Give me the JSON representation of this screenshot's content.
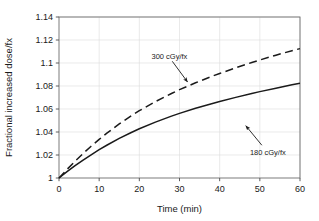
{
  "chart_data": {
    "type": "line",
    "title": "",
    "xlabel": "Time (min)",
    "ylabel": "Fractional increased dose/fx",
    "xlim": [
      0,
      60
    ],
    "ylim": [
      1,
      1.14
    ],
    "xticks": [
      "0",
      "10",
      "20",
      "30",
      "40",
      "50",
      "60"
    ],
    "yticks": [
      "1",
      "1.02",
      "1.04",
      "1.06",
      "1.08",
      "1.1",
      "1.12",
      "1.14"
    ],
    "xtick_values": [
      0,
      10,
      20,
      30,
      40,
      50,
      60
    ],
    "ytick_values": [
      1,
      1.02,
      1.04,
      1.06,
      1.08,
      1.1,
      1.12,
      1.14
    ],
    "grid": true,
    "legend": "annotations",
    "x": [
      0,
      2,
      4,
      6,
      8,
      10,
      12,
      15,
      18,
      20,
      24,
      28,
      30,
      34,
      38,
      40,
      44,
      48,
      50,
      54,
      58,
      60
    ],
    "series": [
      {
        "name": "300 cGy/fx",
        "style": "dashed",
        "color": "#1a1a1a",
        "values": [
          1.0,
          1.0075,
          1.0146,
          1.0213,
          1.0276,
          1.0336,
          1.0392,
          1.047,
          1.0541,
          1.0585,
          1.0664,
          1.0735,
          1.0768,
          1.0828,
          1.0883,
          1.0909,
          1.0958,
          1.1004,
          1.1026,
          1.1068,
          1.1107,
          1.1125
        ]
      },
      {
        "name": "180 cGy/fx",
        "style": "solid",
        "color": "#1a1a1a",
        "values": [
          1.0,
          1.0055,
          1.0107,
          1.0156,
          1.0202,
          1.0246,
          1.0287,
          1.0344,
          1.0396,
          1.0428,
          1.0486,
          1.0538,
          1.0562,
          1.0606,
          1.0646,
          1.0665,
          1.0701,
          1.0735,
          1.0751,
          1.0781,
          1.081,
          1.0823
        ]
      }
    ],
    "annotations": [
      {
        "label": "300 cGy/fx",
        "text_x": 27.5,
        "text_y": 1.1065,
        "arrow_from": [
          28.2,
          1.1015
        ],
        "arrow_to": [
          32.0,
          1.0835
        ]
      },
      {
        "label": "180 cGy/fx",
        "text_x": 52.0,
        "text_y": 1.0228,
        "arrow_from": [
          50.5,
          1.0285
        ],
        "arrow_to": [
          46.5,
          1.0455
        ]
      }
    ]
  }
}
